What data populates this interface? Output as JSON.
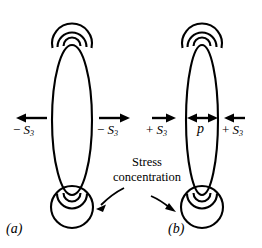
{
  "figure": {
    "background": "#ffffff",
    "stroke_color": "#000000",
    "panels": [
      {
        "id": "a",
        "caption": "(a)",
        "cavity_shape": "vertical-ellipse",
        "cavity_width": 40,
        "cavity_height": 150,
        "top_feature": "three-nested-circles",
        "bottom_feature": "three-nested-circles",
        "left_arrow": {
          "direction": "left",
          "label_sign": "−",
          "label_symbol": "S",
          "label_subscript": "3"
        },
        "right_arrow": {
          "direction": "right",
          "label_sign": "−",
          "label_symbol": "S",
          "label_subscript": "3"
        },
        "internal_pressure_arrow": null
      },
      {
        "id": "b",
        "caption": "(b)",
        "cavity_shape": "vertical-ellipse",
        "cavity_width": 32,
        "cavity_height": 150,
        "top_feature": "three-nested-circles",
        "bottom_feature": "three-nested-circles",
        "left_arrow": {
          "direction": "right",
          "label_sign": "+",
          "label_symbol": "S",
          "label_subscript": "3"
        },
        "right_arrow": {
          "direction": "left",
          "label_sign": "+",
          "label_symbol": "S",
          "label_subscript": "3"
        },
        "internal_pressure_arrow": {
          "direction": "double",
          "label_symbol": "p"
        }
      }
    ],
    "annotation": {
      "line1": "Stress",
      "line2": "concentration",
      "pointer_targets": [
        "panel-a-bottom-circles",
        "panel-b-bottom-circles"
      ]
    }
  }
}
